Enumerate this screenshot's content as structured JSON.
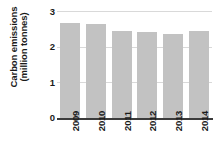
{
  "chart_data": {
    "type": "bar",
    "title": "",
    "subtitle": "",
    "xlabel": "",
    "ylabel_line1": "Carbon emissions",
    "ylabel_line2": "(million tonnes)",
    "ylabel": "Carbon emissions (million tonnes)",
    "categories": [
      "2009",
      "2010",
      "2011",
      "2012",
      "2013",
      "2014"
    ],
    "values": [
      2.65,
      2.63,
      2.45,
      2.4,
      2.35,
      2.43
    ],
    "ylim": [
      0,
      3
    ],
    "yticks": [
      0,
      1,
      2,
      3
    ],
    "ytick_labels": [
      "0",
      "1",
      "2",
      "3"
    ],
    "grid": true,
    "legend": "none",
    "bar_color": "#c2c2c2",
    "gridline_color": "#d9d9d9",
    "axis_color": "#3b3b3b",
    "text_color": "#1b1b1b",
    "background_color": "#ffffff"
  }
}
